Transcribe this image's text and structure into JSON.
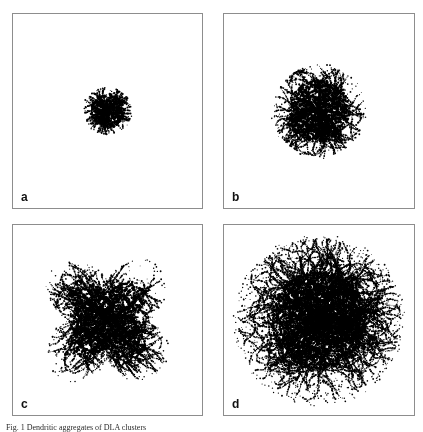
{
  "figure": {
    "caption": "Fig. 1  Dendritic aggregates of DLA clusters",
    "background_color": "#ffffff",
    "ink_color": "#000000",
    "border_color": "#8d8d8d"
  },
  "panels": [
    {
      "id": "a",
      "label": "a",
      "description": "small dense compact aggregate cluster"
    },
    {
      "id": "b",
      "label": "b",
      "description": "medium branched aggregate cluster"
    },
    {
      "id": "c",
      "label": "c",
      "description": "anisotropic four-armed cross-shaped dendritic cluster"
    },
    {
      "id": "d",
      "label": "d",
      "description": "large highly branched fractal dendritic cluster"
    }
  ],
  "chart_data": {
    "type": "scatter",
    "xlabel": "",
    "ylabel": "",
    "grid": false,
    "legend_position": "none",
    "panels": [
      {
        "label": "a",
        "particles": 1400,
        "center": [
          0.5,
          0.5
        ],
        "radius_fraction": 0.125,
        "anisotropy": 0.0,
        "branchiness": 0.12,
        "seed": 11
      },
      {
        "label": "b",
        "particles": 4200,
        "center": [
          0.5,
          0.5
        ],
        "radius_fraction": 0.24,
        "anisotropy": 0.1,
        "branchiness": 0.34,
        "seed": 27
      },
      {
        "label": "c",
        "particles": 6500,
        "center": [
          0.5,
          0.5
        ],
        "radius_fraction": 0.33,
        "anisotropy": 0.62,
        "branchiness": 0.55,
        "seed": 43
      },
      {
        "label": "d",
        "particles": 14000,
        "center": [
          0.5,
          0.5
        ],
        "radius_fraction": 0.43,
        "anisotropy": 0.18,
        "branchiness": 0.72,
        "seed": 61
      }
    ]
  }
}
